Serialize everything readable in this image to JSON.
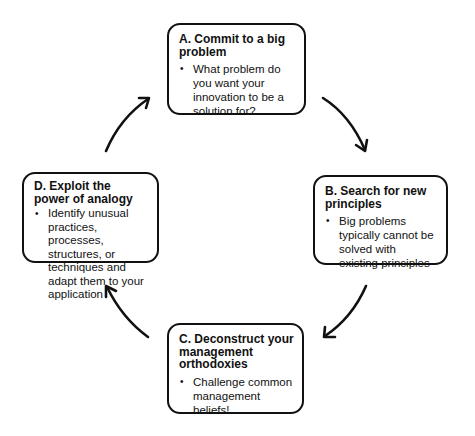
{
  "diagram": {
    "type": "cycle",
    "direction": "clockwise",
    "steps": [
      {
        "id": "A",
        "title": "A. Commit to a big problem",
        "bullets": [
          "What problem do you want your innovation to be a solution for?"
        ]
      },
      {
        "id": "B",
        "title": "B. Search for new principles",
        "bullets": [
          "Big problems typically cannot be solved with existing principles"
        ]
      },
      {
        "id": "C",
        "title": "C. Deconstruct your management orthodoxies",
        "bullets": [
          "Challenge common management beliefs!"
        ]
      },
      {
        "id": "D",
        "title": "D. Exploit the power of analogy",
        "bullets": [
          "Identify unusual practices, processes, structures, or techniques and adapt them to your application"
        ]
      }
    ],
    "arrows": [
      {
        "from": "A",
        "to": "B"
      },
      {
        "from": "B",
        "to": "C"
      },
      {
        "from": "C",
        "to": "D"
      },
      {
        "from": "D",
        "to": "A"
      }
    ],
    "colors": {
      "stroke": "#111111",
      "background": "#ffffff"
    }
  }
}
